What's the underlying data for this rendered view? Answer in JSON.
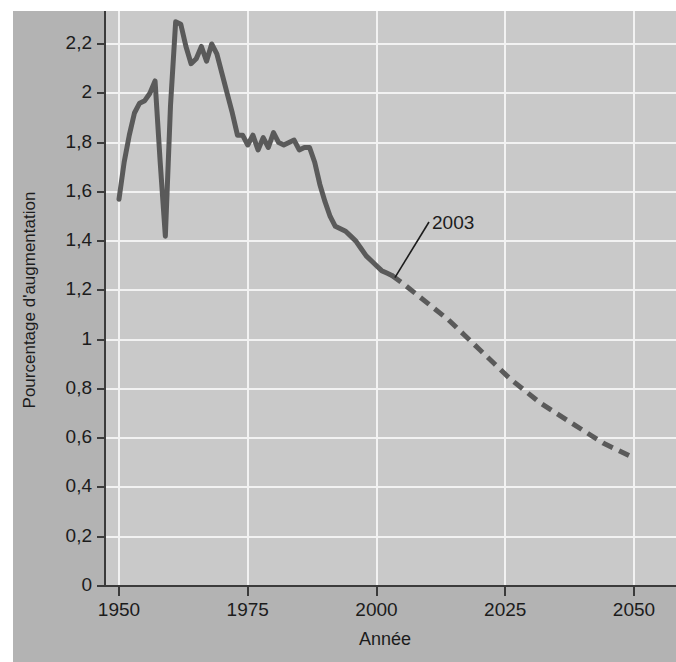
{
  "chart_data": {
    "type": "line",
    "title": "",
    "xlabel": "Année",
    "ylabel": "Pourcentage d'augmentation",
    "xlim": [
      1950,
      2050
    ],
    "ylim": [
      0,
      2.3
    ],
    "grid": true,
    "legend": "none",
    "x_ticks": [
      "1950",
      "1975",
      "2000",
      "2025",
      "2050"
    ],
    "x_tick_values": [
      1950,
      1975,
      2000,
      2025,
      2050
    ],
    "y_ticks": [
      "0",
      "0,2",
      "0,4",
      "0,6",
      "0,8",
      "1",
      "1,2",
      "1,4",
      "1,6",
      "1,8",
      "2",
      "2,2"
    ],
    "y_tick_values": [
      0,
      0.2,
      0.4,
      0.6,
      0.8,
      1.0,
      1.2,
      1.4,
      1.6,
      1.8,
      2.0,
      2.2
    ],
    "annotations": [
      {
        "label": "2003",
        "x": 2003,
        "y": 1.26,
        "note": "transition point between observed (solid) and projected (dashed) series"
      }
    ],
    "series": [
      {
        "name": "observé",
        "style": "solid",
        "color": "#5a5a5a",
        "x": [
          1950,
          1951,
          1952,
          1953,
          1954,
          1955,
          1956,
          1957,
          1958,
          1959,
          1960,
          1961,
          1962,
          1963,
          1964,
          1965,
          1966,
          1967,
          1968,
          1969,
          1970,
          1971,
          1972,
          1973,
          1974,
          1975,
          1976,
          1977,
          1978,
          1979,
          1980,
          1981,
          1982,
          1983,
          1984,
          1985,
          1986,
          1987,
          1988,
          1989,
          1990,
          1991,
          1992,
          1993,
          1994,
          1995,
          1996,
          1997,
          1998,
          1999,
          2000,
          2001,
          2002,
          2003
        ],
        "y": [
          1.57,
          1.72,
          1.83,
          1.92,
          1.96,
          1.97,
          2.0,
          2.05,
          1.72,
          1.42,
          1.95,
          2.29,
          2.28,
          2.19,
          2.12,
          2.14,
          2.19,
          2.13,
          2.2,
          2.16,
          2.08,
          2.0,
          1.92,
          1.83,
          1.83,
          1.79,
          1.83,
          1.77,
          1.82,
          1.78,
          1.84,
          1.8,
          1.79,
          1.8,
          1.81,
          1.77,
          1.78,
          1.78,
          1.72,
          1.63,
          1.56,
          1.5,
          1.46,
          1.45,
          1.44,
          1.42,
          1.4,
          1.37,
          1.34,
          1.32,
          1.3,
          1.28,
          1.27,
          1.26
        ]
      },
      {
        "name": "projeté",
        "style": "dashed",
        "color": "#5a5a5a",
        "x": [
          2003,
          2005,
          2008,
          2011,
          2014,
          2017,
          2020,
          2023,
          2026,
          2029,
          2032,
          2035,
          2038,
          2041,
          2044,
          2047,
          2050
        ],
        "y": [
          1.26,
          1.23,
          1.18,
          1.13,
          1.08,
          1.02,
          0.96,
          0.9,
          0.84,
          0.79,
          0.74,
          0.7,
          0.66,
          0.62,
          0.58,
          0.55,
          0.52
        ]
      }
    ],
    "colors": {
      "outer_panel": "#b3b3b3",
      "plot_panel": "#c9c9c9",
      "gridline": "#f2f2f2",
      "axis": "#3b3b3b",
      "line": "#5a5a5a",
      "text": "#1c1c1c"
    }
  }
}
